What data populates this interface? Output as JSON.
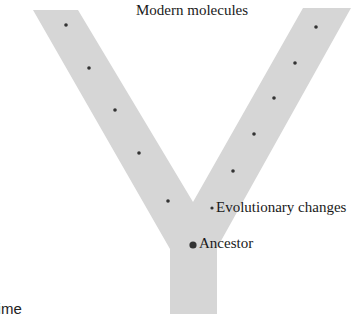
{
  "diagram": {
    "title": "Modern molecules",
    "labels": {
      "evolutionary_changes": "Evolutionary changes",
      "ancestor": "Ancestor",
      "time_axis": "Time"
    },
    "colors": {
      "branch_fill": "#d6d6d6",
      "dot": "#333333",
      "text": "#1a1a1a"
    },
    "shape": "Y-shaped phylogenetic tree (two branches diverging from a common stem)",
    "left_branch_dots": [
      [
        66,
        25
      ],
      [
        89,
        68
      ],
      [
        115,
        110
      ],
      [
        139,
        153
      ],
      [
        168,
        201
      ]
    ],
    "right_branch_dots": [
      [
        316,
        27
      ],
      [
        295,
        63
      ],
      [
        274,
        98
      ],
      [
        254,
        134
      ],
      [
        233,
        171
      ]
    ],
    "evolutionary_change_marker": [
      212,
      208
    ],
    "ancestor_marker": [
      193,
      245
    ]
  }
}
